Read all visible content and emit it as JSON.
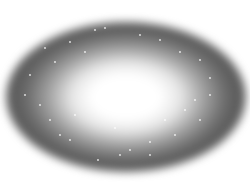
{
  "image": {
    "description": "Grayscale elliptical galaxy with bright white core, dark gray outer halo and scattered faint white star points on white background",
    "colors": {
      "background": "#ffffff",
      "core": "#ffffff",
      "halo": "#5a5a5a"
    },
    "stars": [
      [
        95,
        30
      ],
      [
        105,
        28
      ],
      [
        85,
        52
      ],
      [
        45,
        48
      ],
      [
        55,
        62
      ],
      [
        30,
        75
      ],
      [
        70,
        42
      ],
      [
        160,
        40
      ],
      [
        180,
        52
      ],
      [
        200,
        60
      ],
      [
        210,
        78
      ],
      [
        195,
        100
      ],
      [
        200,
        120
      ],
      [
        175,
        135
      ],
      [
        150,
        142
      ],
      [
        130,
        150
      ],
      [
        98,
        160
      ],
      [
        70,
        140
      ],
      [
        50,
        120
      ],
      [
        40,
        105
      ],
      [
        75,
        115
      ],
      [
        115,
        128
      ],
      [
        165,
        120
      ],
      [
        185,
        110
      ],
      [
        140,
        35
      ],
      [
        60,
        135
      ],
      [
        210,
        95
      ],
      [
        25,
        95
      ],
      [
        120,
        155
      ],
      [
        150,
        155
      ]
    ]
  }
}
